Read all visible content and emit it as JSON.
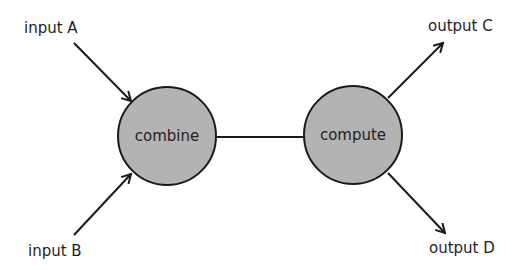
{
  "diagram": {
    "type": "flow",
    "nodes": [
      {
        "id": "combine",
        "label": "combine",
        "shape": "circle",
        "cx": 167,
        "cy": 136,
        "r": 49,
        "fill": "#b3b3b3"
      },
      {
        "id": "compute",
        "label": "compute",
        "shape": "circle",
        "cx": 353,
        "cy": 135,
        "r": 49,
        "fill": "#b3b3b3"
      }
    ],
    "terminals": [
      {
        "id": "input_a",
        "label": "input A"
      },
      {
        "id": "input_b",
        "label": "input B"
      },
      {
        "id": "output_c",
        "label": "output C"
      },
      {
        "id": "output_d",
        "label": "output D"
      }
    ],
    "edges": [
      {
        "from": "input_a",
        "to": "combine",
        "arrow": true
      },
      {
        "from": "input_b",
        "to": "combine",
        "arrow": true
      },
      {
        "from": "combine",
        "to": "compute",
        "arrow": false
      },
      {
        "from": "compute",
        "to": "output_c",
        "arrow": true
      },
      {
        "from": "compute",
        "to": "output_d",
        "arrow": true
      }
    ],
    "colors": {
      "node_fill": "#b3b3b3",
      "stroke": "#1a1a1a",
      "background": "#ffffff"
    }
  }
}
